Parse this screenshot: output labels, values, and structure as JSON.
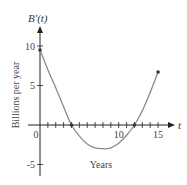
{
  "chart_data": {
    "type": "line",
    "title": "",
    "function_label": "B′(t)",
    "xlabel": "Years",
    "ylabel": "Billions per year",
    "x_axis_var": "t",
    "xlim": [
      0,
      16.5
    ],
    "ylim": [
      -6,
      12
    ],
    "x_ticks": [
      1,
      2,
      3,
      4,
      5,
      6,
      7,
      8,
      9,
      10,
      11,
      12,
      13,
      14,
      15
    ],
    "x_tick_labels": [
      {
        "value": 0,
        "label": "0"
      },
      {
        "value": 10,
        "label": "10"
      },
      {
        "value": 15,
        "label": "15"
      }
    ],
    "y_ticks": [
      -5,
      5,
      10
    ],
    "y_tick_labels": [
      {
        "value": 10,
        "label": "10"
      },
      {
        "value": 5,
        "label": "5"
      },
      {
        "value": -5,
        "label": "-5"
      }
    ],
    "grid": false,
    "series": [
      {
        "name": "B′(t)",
        "x": [
          0,
          1,
          2,
          3,
          4,
          5,
          6,
          7,
          8,
          8.5,
          9,
          10,
          11,
          12,
          13,
          14,
          15
        ],
        "values": [
          9.5,
          7.0,
          4.7,
          2.3,
          0.0,
          -1.4,
          -2.4,
          -2.9,
          -3.0,
          -3.0,
          -2.9,
          -2.3,
          -1.3,
          0.0,
          1.8,
          4.1,
          6.7
        ]
      }
    ],
    "marked_points": [
      {
        "x": 0,
        "y": 9.5
      },
      {
        "x": 4,
        "y": 0
      },
      {
        "x": 12,
        "y": 0
      },
      {
        "x": 15,
        "y": 6.7
      }
    ],
    "colors": {
      "curve": "#8a8a8a",
      "axis": "#222222",
      "points": "#333333"
    }
  }
}
